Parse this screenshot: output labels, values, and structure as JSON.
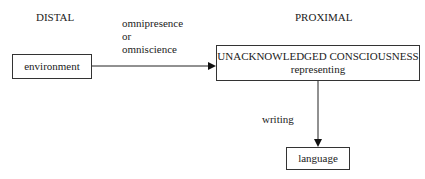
{
  "headings": {
    "distal": "DISTAL",
    "proximal": "PROXIMAL"
  },
  "edge_labels": {
    "horizontal": [
      "omnipresence",
      "or",
      "omniscience"
    ],
    "vertical": "writing"
  },
  "nodes": {
    "environment": "environment",
    "consciousness": {
      "line1": "UNACKNOWLEDGED CONSCIOUSNESS",
      "line2": "representing"
    },
    "language": "language"
  }
}
